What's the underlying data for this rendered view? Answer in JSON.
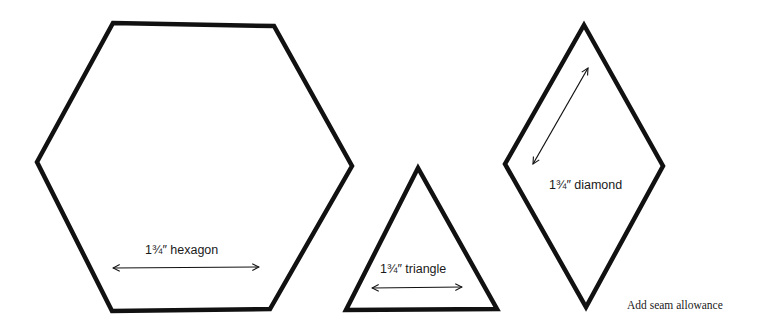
{
  "colors": {
    "stroke": "#111111",
    "background": "#ffffff"
  },
  "shapes": [
    {
      "name": "hexagon",
      "label": "1¾″  hexagon",
      "points": "113,23 274,26 352,166 270,309 112,311 37,162"
    },
    {
      "name": "triangle",
      "label": "1¾″ triangle",
      "points": "418,168 346,310 497,309"
    },
    {
      "name": "diamond",
      "label": "1¾″  diamond",
      "points": "584,25 663,166 586,307 505,164"
    }
  ],
  "note": "Add seam allowance"
}
